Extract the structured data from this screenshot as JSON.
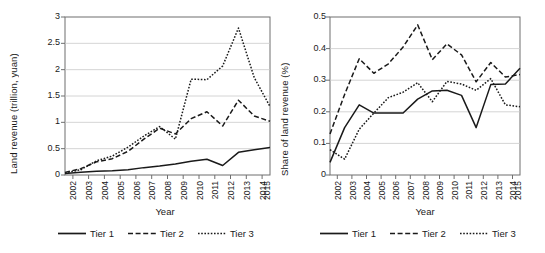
{
  "figure": {
    "panels": [
      {
        "id": "left",
        "ylabel": "Land revenue (trillion, yuan)",
        "xlabel": "Year",
        "yticks": [
          "0",
          "0.5",
          "1",
          "1.5",
          "2",
          "2.5",
          "3"
        ],
        "xticks": [
          "2002",
          "2003",
          "2004",
          "2005",
          "2006",
          "2007",
          "2008",
          "2009",
          "2010",
          "2011",
          "2012",
          "2013",
          "2014",
          "2015"
        ],
        "legend": [
          {
            "label": "Tier 1",
            "style": "solid"
          },
          {
            "label": "Tier 2",
            "style": "dashed"
          },
          {
            "label": "Tier 3",
            "style": "dotted"
          }
        ]
      },
      {
        "id": "right",
        "ylabel": "Share of land revenue (%)",
        "xlabel": "Year",
        "yticks": [
          "0",
          "0.1",
          "0.2",
          "0.3",
          "0.4",
          "0.5"
        ],
        "xticks": [
          "2002",
          "2003",
          "2004",
          "2005",
          "2006",
          "2007",
          "2008",
          "2009",
          "2010",
          "2011",
          "2012",
          "2013",
          "2014",
          "2015"
        ],
        "legend": [
          {
            "label": "Tier 1",
            "style": "solid"
          },
          {
            "label": "Tier 2",
            "style": "dashed"
          },
          {
            "label": "Tier 3",
            "style": "dotted"
          }
        ]
      }
    ],
    "colors": {
      "line": "#1a1a1a",
      "grid": "#c9c9c9",
      "axis": "#6e6e6e",
      "background": "#ffffff"
    }
  },
  "chart_data": [
    {
      "type": "line",
      "title": "",
      "xlabel": "Year",
      "ylabel": "Land revenue (trillion, yuan)",
      "categories": [
        2002,
        2003,
        2004,
        2005,
        2006,
        2007,
        2008,
        2009,
        2010,
        2011,
        2012,
        2013,
        2014,
        2015
      ],
      "ylim": [
        0,
        3
      ],
      "yticks": [
        0,
        0.5,
        1,
        1.5,
        2,
        2.5,
        3
      ],
      "grid": true,
      "legend_position": "bottom",
      "series": [
        {
          "name": "Tier 1",
          "style": "solid",
          "values": [
            0.03,
            0.05,
            0.07,
            0.08,
            0.1,
            0.14,
            0.17,
            0.21,
            0.26,
            0.3,
            0.18,
            0.43,
            0.48,
            0.52
          ]
        },
        {
          "name": "Tier 2",
          "style": "dashed",
          "values": [
            0.05,
            0.12,
            0.25,
            0.31,
            0.45,
            0.68,
            0.89,
            0.78,
            1.07,
            1.2,
            0.93,
            1.42,
            1.12,
            1.02
          ]
        },
        {
          "name": "Tier 3",
          "style": "dotted",
          "values": [
            0.04,
            0.1,
            0.27,
            0.36,
            0.53,
            0.74,
            0.92,
            0.68,
            1.82,
            1.81,
            2.07,
            2.79,
            1.85,
            1.3
          ]
        }
      ]
    },
    {
      "type": "line",
      "title": "",
      "xlabel": "Year",
      "ylabel": "Share of land revenue (%)",
      "categories": [
        2002,
        2003,
        2004,
        2005,
        2006,
        2007,
        2008,
        2009,
        2010,
        2011,
        2012,
        2013,
        2014,
        2015
      ],
      "ylim": [
        0,
        0.5
      ],
      "yticks": [
        0,
        0.1,
        0.2,
        0.3,
        0.4,
        0.5
      ],
      "grid": true,
      "legend_position": "bottom",
      "series": [
        {
          "name": "Tier 1",
          "style": "solid",
          "values": [
            0.04,
            0.15,
            0.222,
            0.196,
            0.196,
            0.196,
            0.24,
            0.266,
            0.268,
            0.252,
            0.15,
            0.286,
            0.288,
            0.338
          ]
        },
        {
          "name": "Tier 2",
          "style": "dashed",
          "values": [
            0.13,
            0.255,
            0.368,
            0.322,
            0.352,
            0.405,
            0.475,
            0.365,
            0.415,
            0.38,
            0.295,
            0.356,
            0.31,
            0.318
          ]
        },
        {
          "name": "Tier 3",
          "style": "dotted",
          "values": [
            0.08,
            0.05,
            0.145,
            0.196,
            0.245,
            0.262,
            0.292,
            0.232,
            0.296,
            0.288,
            0.268,
            0.305,
            0.222,
            0.216
          ]
        }
      ]
    }
  ]
}
